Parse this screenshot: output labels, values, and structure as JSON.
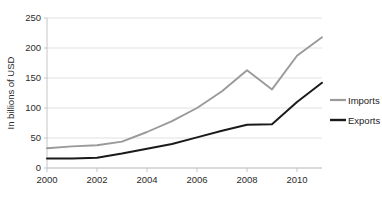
{
  "chart_data": {
    "type": "line",
    "title": "",
    "xlabel": "",
    "ylabel": "In billions of USD",
    "x": [
      2000,
      2001,
      2002,
      2003,
      2004,
      2005,
      2006,
      2007,
      2008,
      2009,
      2010,
      2011
    ],
    "xlim": [
      2000,
      2011
    ],
    "ylim": [
      0,
      250
    ],
    "xticks": [
      "2000",
      "2002",
      "2004",
      "2006",
      "2008",
      "2010"
    ],
    "xtick_values": [
      2000,
      2002,
      2004,
      2006,
      2008,
      2010
    ],
    "yticks": [
      "0",
      "50",
      "100",
      "150",
      "200",
      "250"
    ],
    "ytick_values": [
      0,
      50,
      100,
      150,
      200,
      250
    ],
    "grid": true,
    "grid_axis": "y",
    "legend_position": "right",
    "series": [
      {
        "name": "Imports",
        "color": "#9a9a9a",
        "values": [
          33,
          36,
          38,
          44,
          60,
          78,
          100,
          128,
          163,
          131,
          187,
          218
        ]
      },
      {
        "name": "Exports",
        "color": "#1a1a1a",
        "values": [
          16,
          16,
          17,
          24,
          32,
          40,
          51,
          62,
          72,
          73,
          110,
          142
        ]
      }
    ]
  },
  "legend": {
    "items": [
      {
        "label": "Imports",
        "color": "#9a9a9a"
      },
      {
        "label": "Exports",
        "color": "#1a1a1a"
      }
    ]
  },
  "colors": {
    "imports": "#9a9a9a",
    "exports": "#1a1a1a",
    "grid": "#d9d9d9",
    "axis": "#bfbfbf",
    "text": "#2b2b2b",
    "background": "#ffffff"
  }
}
